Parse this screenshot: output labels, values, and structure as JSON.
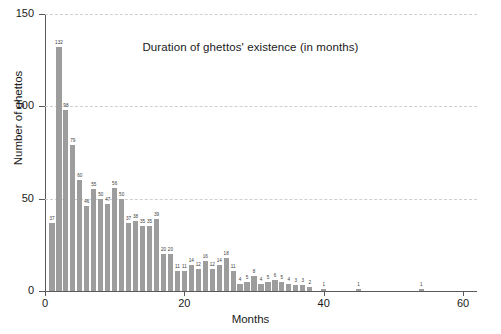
{
  "chart_data": {
    "type": "bar",
    "title": "Duration of ghettos' existence (in months)",
    "xlabel": "Months",
    "ylabel": "Number of ghettos",
    "xlim": [
      0,
      62
    ],
    "ylim": [
      0,
      150
    ],
    "xticks": [
      0,
      20,
      40,
      60
    ],
    "yticks": [
      0,
      50,
      100,
      150
    ],
    "grid": true,
    "legend": null,
    "bar_color": "#9d9d9d",
    "x": [
      1,
      2,
      3,
      4,
      5,
      6,
      7,
      8,
      9,
      10,
      11,
      12,
      13,
      14,
      15,
      16,
      17,
      18,
      19,
      20,
      21,
      22,
      23,
      24,
      25,
      26,
      27,
      28,
      29,
      30,
      31,
      32,
      33,
      34,
      35,
      36,
      37,
      38,
      40,
      45,
      54
    ],
    "values": [
      37,
      132,
      98,
      79,
      60,
      46,
      55,
      50,
      47,
      56,
      50,
      37,
      38,
      35,
      35,
      39,
      20,
      20,
      11,
      11,
      14,
      12,
      16,
      12,
      14,
      18,
      11,
      4,
      5,
      8,
      4,
      5,
      6,
      5,
      4,
      3,
      3,
      2,
      1,
      1,
      1
    ],
    "value_labels": [
      "37",
      "132",
      "98",
      "79",
      "60",
      "46",
      "55",
      "50",
      "47",
      "56",
      "50",
      "37",
      "38",
      "35",
      "35",
      "39",
      "20",
      "20",
      "11",
      "11",
      "14",
      "12",
      "16",
      "12",
      "14",
      "18",
      "11",
      "4",
      "5",
      "8",
      "4",
      "5",
      "6",
      "5",
      "4",
      "3",
      "3",
      "2",
      "1",
      "1",
      "1"
    ]
  },
  "axis": {
    "ytick_labels": [
      "0",
      "50",
      "100",
      "150"
    ],
    "xtick_labels": [
      "0",
      "20",
      "40",
      "60"
    ]
  }
}
